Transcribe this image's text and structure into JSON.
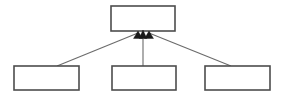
{
  "diagram": {
    "type": "uml-generalization",
    "canvas": {
      "width": 282,
      "height": 103,
      "background": "#ffffff"
    },
    "style": {
      "box_fill": "#ffffff",
      "box_stroke": "#4d4d4d",
      "box_stroke_width": 1.6,
      "line_stroke": "#6b6b6b",
      "line_stroke_width": 1.1,
      "arrow_fill": "#1a1a1a"
    },
    "nodes": [
      {
        "id": "superclass",
        "role": "parent",
        "label": "",
        "x": 111,
        "y": 6,
        "width": 64,
        "height": 25
      },
      {
        "id": "subclass-left",
        "role": "child",
        "label": "",
        "x": 14,
        "y": 66,
        "width": 65,
        "height": 24
      },
      {
        "id": "subclass-middle",
        "role": "child",
        "label": "",
        "x": 112,
        "y": 66,
        "width": 64,
        "height": 24
      },
      {
        "id": "subclass-right",
        "role": "child",
        "label": "",
        "x": 205,
        "y": 66,
        "width": 65,
        "height": 24
      }
    ],
    "edges": [
      {
        "id": "edge-left",
        "from": "subclass-left",
        "to": "superclass",
        "kind": "generalization",
        "arrowhead": "solid-triangle",
        "path": "M 57 66 L 138 33",
        "arrow_points": "138,31 133.5,38.5 142.5,38.5"
      },
      {
        "id": "edge-middle",
        "from": "subclass-middle",
        "to": "superclass",
        "kind": "generalization",
        "arrowhead": "solid-triangle",
        "path": "M 143 66 L 143 33",
        "arrow_points": "143,30 139.2,38.5 146.8,38.5"
      },
      {
        "id": "edge-right",
        "from": "subclass-right",
        "to": "superclass",
        "kind": "generalization",
        "arrowhead": "solid-triangle",
        "path": "M 231 66 L 149 33",
        "arrow_points": "149,31 144.5,38.5 153.5,38.5"
      }
    ]
  }
}
